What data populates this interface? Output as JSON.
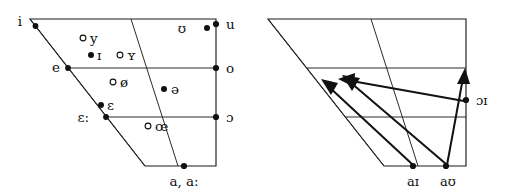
{
  "figure": {
    "background_color": "#ffffff",
    "line_color": "#111111",
    "width": 507,
    "height": 193
  },
  "left_chart": {
    "name": "monophthong-vowel-quadrilateral",
    "monophthongs": [
      {
        "symbol": "i",
        "rounding": "unrounded",
        "marker": "filled",
        "edge": "left"
      },
      {
        "symbol": "e",
        "rounding": "unrounded",
        "marker": "filled",
        "edge": "left"
      },
      {
        "symbol": "ɛ:",
        "rounding": "unrounded",
        "marker": "filled",
        "edge": "left"
      },
      {
        "symbol": "y",
        "rounding": "rounded",
        "marker": "hollow",
        "edge": "inner"
      },
      {
        "symbol": "ɪ",
        "rounding": "unrounded",
        "marker": "filled",
        "edge": "inner"
      },
      {
        "symbol": "ʏ",
        "rounding": "rounded",
        "marker": "hollow",
        "edge": "inner"
      },
      {
        "symbol": "ø",
        "rounding": "rounded",
        "marker": "hollow",
        "edge": "inner"
      },
      {
        "symbol": "ɛ",
        "rounding": "unrounded",
        "marker": "filled",
        "edge": "inner"
      },
      {
        "symbol": "œ",
        "rounding": "rounded",
        "marker": "hollow",
        "edge": "inner"
      },
      {
        "symbol": "ə",
        "rounding": "unrounded",
        "marker": "filled",
        "edge": "inner"
      },
      {
        "symbol": "ʊ",
        "rounding": "rounded",
        "marker": "filled",
        "edge": "inner"
      },
      {
        "symbol": "u",
        "rounding": "rounded",
        "marker": "filled",
        "edge": "right"
      },
      {
        "symbol": "o",
        "rounding": "rounded",
        "marker": "filled",
        "edge": "right"
      },
      {
        "symbol": "ɔ",
        "rounding": "rounded",
        "marker": "filled",
        "edge": "right"
      },
      {
        "symbol": "a, a:",
        "rounding": "unrounded",
        "marker": "filled",
        "edge": "bottom"
      }
    ]
  },
  "right_chart": {
    "name": "diphthong-vowel-quadrilateral",
    "diphthongs": [
      {
        "symbol": "aɪ",
        "start": "a",
        "end": "ɪ",
        "direction": "up-left"
      },
      {
        "symbol": "aʊ",
        "start": "a",
        "end": "ʊ",
        "direction": "up-left"
      },
      {
        "symbol": "ɔɪ",
        "start": "ɔ",
        "end": "ɪ",
        "direction": "up-right"
      }
    ]
  }
}
